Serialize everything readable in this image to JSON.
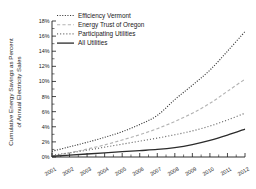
{
  "chart_data": {
    "type": "line",
    "title": "",
    "xlabel": "",
    "ylabel": "Cumulative Energy Savings as Percent of Annual Electricity Sales",
    "ylabel_line1": "Cumulative Energy Savings as Percent",
    "ylabel_line2": "of Annual Electricity Sales",
    "categories": [
      "2001",
      "2002",
      "2003",
      "2004",
      "2005",
      "2006",
      "2007",
      "2008",
      "2009",
      "2010",
      "2011",
      "2012"
    ],
    "x": [
      2001,
      2002,
      2003,
      2004,
      2005,
      2006,
      2007,
      2008,
      2009,
      2010,
      2011,
      2012
    ],
    "xlim": [
      2001,
      2012
    ],
    "ylim": [
      0,
      18
    ],
    "ytick_labels": [
      "0%",
      "2%",
      "4%",
      "6%",
      "8%",
      "10%",
      "12%",
      "14%",
      "16%",
      "18%"
    ],
    "ytick_values": [
      0,
      2,
      4,
      6,
      8,
      10,
      12,
      14,
      16,
      18
    ],
    "xtick_labels": [
      "2001",
      "2002",
      "2003",
      "2004",
      "2005",
      "2006",
      "2007",
      "2008",
      "2009",
      "2010",
      "2011",
      "2012"
    ],
    "grid": false,
    "legend_position": "top-left",
    "series": [
      {
        "name": "Efficiency Vermont",
        "style": "dotted",
        "color": "#3a3a3a",
        "values": [
          0.75,
          1.35,
          1.95,
          2.6,
          3.35,
          4.3,
          5.5,
          7.6,
          9.5,
          11.5,
          14.0,
          16.6
        ]
      },
      {
        "name": "Energy Trust of Oregon",
        "style": "dashed",
        "color": "#b4b4b4",
        "values": [
          0.1,
          0.55,
          1.05,
          1.6,
          2.25,
          2.95,
          3.75,
          4.7,
          5.8,
          7.1,
          8.7,
          10.3
        ]
      },
      {
        "name": "Participating Utilities",
        "style": "dotted-sparse",
        "color": "#6e6e6e",
        "values": [
          0.25,
          0.55,
          0.9,
          1.3,
          1.7,
          2.1,
          2.5,
          2.95,
          3.45,
          4.1,
          4.9,
          5.8
        ]
      },
      {
        "name": "All Utilities",
        "style": "solid",
        "color": "#2b2b2b",
        "values": [
          0.1,
          0.25,
          0.4,
          0.55,
          0.7,
          0.85,
          1.0,
          1.25,
          1.65,
          2.2,
          2.9,
          3.7
        ]
      }
    ]
  },
  "legend": {
    "items": [
      {
        "label": "Efficiency Vermont"
      },
      {
        "label": "Energy Trust of Oregon"
      },
      {
        "label": "Participating Utilities"
      },
      {
        "label": "All Utilities"
      }
    ]
  }
}
